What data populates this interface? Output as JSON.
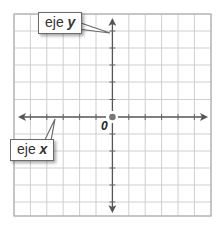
{
  "diagram": {
    "type": "coordinate-plane",
    "grid": {
      "columns": 12,
      "rows": 12,
      "line_color": "#c8c8c8",
      "border_color": "#a8a8a8"
    },
    "axis_color": "#555555",
    "origin_label": "0",
    "callouts": {
      "y_axis": {
        "word": "eje",
        "var": "y"
      },
      "x_axis": {
        "word": "eje",
        "var": "x"
      }
    }
  }
}
